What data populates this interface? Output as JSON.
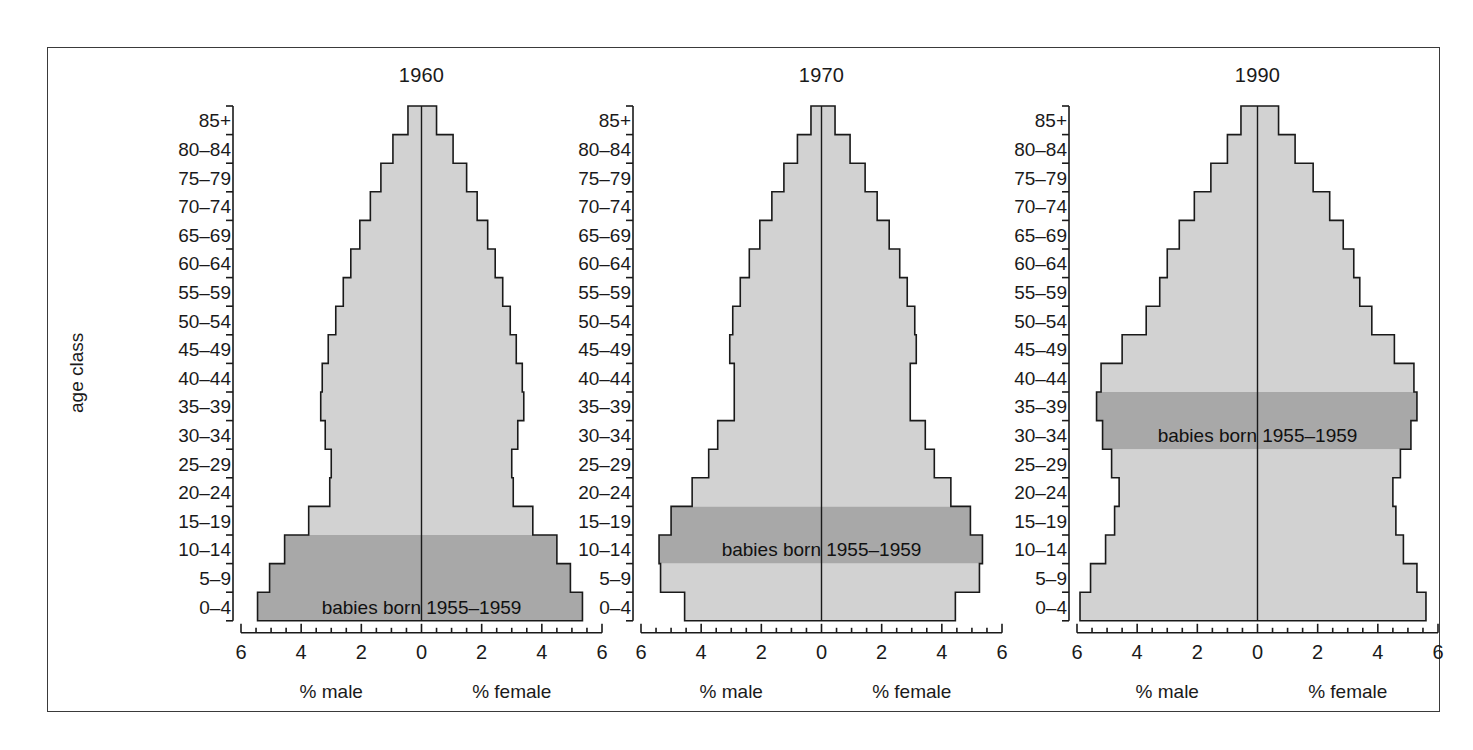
{
  "figure": {
    "y_axis_caption": "age class",
    "age_classes": [
      "0–4",
      "5–9",
      "10–14",
      "15–19",
      "20–24",
      "25–29",
      "30–34",
      "35–39",
      "40–44",
      "45–49",
      "50–54",
      "55–59",
      "60–64",
      "65–69",
      "70–74",
      "75–79",
      "80–84",
      "85+"
    ],
    "male_caption": "% male",
    "female_caption": "% female",
    "x_tick_labels": [
      "6",
      "4",
      "2",
      "0",
      "2",
      "4",
      "6"
    ],
    "annotation_text": "babies born 1955–1959",
    "colors": {
      "frame": "#3a3a3a",
      "outline": "#1a1a1a",
      "light_band": "#d2d2d2",
      "dark_band": "#a8a8a8",
      "text": "#1a1a1a",
      "background": "#ffffff"
    }
  },
  "chart_data": {
    "type": "bar",
    "chart_kind": "population-pyramid",
    "title": "",
    "xlabel": "% male / % female",
    "ylabel": "age class",
    "xlim": [
      -6,
      6
    ],
    "x_ticks": [
      -6,
      -4,
      -2,
      0,
      2,
      4,
      6
    ],
    "x_tick_labels": [
      "6",
      "4",
      "2",
      "0",
      "2",
      "4",
      "6"
    ],
    "grid": false,
    "legend": "none",
    "categories": [
      "0–4",
      "5–9",
      "10–14",
      "15–19",
      "20–24",
      "25–29",
      "30–34",
      "35–39",
      "40–44",
      "45–49",
      "50–54",
      "55–59",
      "60–64",
      "65–69",
      "70–74",
      "75–79",
      "80–84",
      "85+"
    ],
    "panels": [
      {
        "title": "1960",
        "highlight_annotation": "babies born 1955–1959",
        "highlight_cohort_index": 0,
        "highlight_band_from": 0,
        "highlight_band_to": 2,
        "series": [
          {
            "name": "% male",
            "side": "left",
            "values": [
              5.45,
              5.05,
              4.55,
              3.75,
              3.05,
              3.0,
              3.2,
              3.35,
              3.3,
              3.1,
              2.85,
              2.6,
              2.35,
              2.05,
              1.7,
              1.35,
              0.95,
              0.45
            ]
          },
          {
            "name": "% female",
            "side": "right",
            "values": [
              5.35,
              4.95,
              4.5,
              3.7,
              3.05,
              3.0,
              3.2,
              3.4,
              3.35,
              3.15,
              2.95,
              2.7,
              2.45,
              2.2,
              1.85,
              1.5,
              1.05,
              0.5
            ]
          }
        ]
      },
      {
        "title": "1970",
        "highlight_annotation": "babies born 1955–1959",
        "highlight_cohort_index": 2,
        "highlight_band_from": 2,
        "highlight_band_to": 3,
        "series": [
          {
            "name": "% male",
            "side": "left",
            "values": [
              4.55,
              5.35,
              5.4,
              5.0,
              4.3,
              3.75,
              3.45,
              2.9,
              2.9,
              3.05,
              2.95,
              2.7,
              2.4,
              2.05,
              1.65,
              1.25,
              0.8,
              0.35
            ]
          },
          {
            "name": "% female",
            "side": "right",
            "values": [
              4.45,
              5.25,
              5.35,
              4.95,
              4.3,
              3.75,
              3.45,
              2.95,
              2.95,
              3.15,
              3.1,
              2.85,
              2.6,
              2.25,
              1.85,
              1.45,
              0.95,
              0.45
            ]
          }
        ]
      },
      {
        "title": "1990",
        "highlight_annotation": "babies born 1955–1959",
        "highlight_cohort_index": 6,
        "highlight_band_from": 6,
        "highlight_band_to": 7,
        "series": [
          {
            "name": "% male",
            "side": "left",
            "values": [
              5.9,
              5.55,
              5.05,
              4.75,
              4.6,
              4.85,
              5.15,
              5.35,
              5.2,
              4.5,
              3.7,
              3.25,
              3.0,
              2.6,
              2.1,
              1.55,
              1.0,
              0.55
            ]
          },
          {
            "name": "% female",
            "side": "right",
            "values": [
              5.6,
              5.3,
              4.85,
              4.6,
              4.5,
              4.75,
              5.1,
              5.3,
              5.2,
              4.55,
              3.8,
              3.4,
              3.2,
              2.85,
              2.4,
              1.85,
              1.25,
              0.7
            ]
          }
        ]
      }
    ]
  }
}
